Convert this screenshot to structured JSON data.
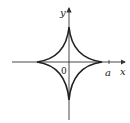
{
  "diagram": {
    "type": "astroid",
    "labels": {
      "y_axis": "y",
      "x_axis": "x",
      "origin": "0",
      "x_intercept": "a"
    },
    "colors": {
      "curve": "#222222",
      "axis": "#333333",
      "background": "#ffffff"
    }
  }
}
